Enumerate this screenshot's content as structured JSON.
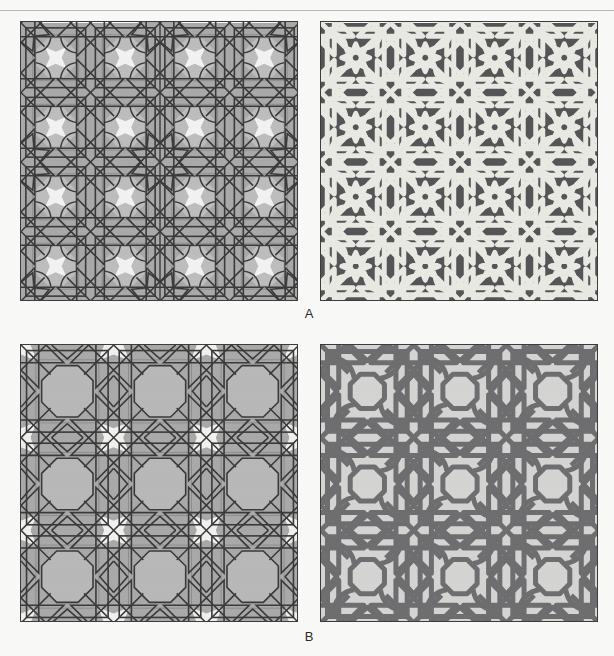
{
  "figure": {
    "caption_rows": [
      {
        "id": "A",
        "label": "A"
      },
      {
        "id": "B",
        "label": "B"
      }
    ],
    "panels": [
      {
        "id": "a-left",
        "name": "pattern-A-construction",
        "row": "A",
        "column": "left",
        "style": "tiling-with-line-overlay",
        "description": "Gray polygonal tiling with thin dark-grey overlay of an 8-pointed star polygonal network; white four-pointed rosette tiles.",
        "colors": {
          "background_tile": "#a9a9a9",
          "secondary_tile": "#bdbdbd",
          "highlight_tile": "#f2f2f2",
          "line": "#3a3a3a",
          "faint_line": "#8d8d8d",
          "border": "#3c3c3c"
        },
        "grid": {
          "cells_x": 4,
          "cells_y": 4
        },
        "line_width": 1.6
      },
      {
        "id": "a-right",
        "name": "pattern-A-interlace",
        "row": "A",
        "column": "right",
        "style": "interlaced-strapwork",
        "description": "Dark charcoal field with wide light-grey interlacing strapwork forming 8-pointed stars.",
        "colors": {
          "field": "#555557",
          "strap": "#e9e9e4",
          "strap_edge": "#d2d2cd",
          "border": "#2f2f2f"
        },
        "grid": {
          "cells_x": 4,
          "cells_y": 4
        },
        "line_width": 5.0
      },
      {
        "id": "b-left",
        "name": "pattern-B-construction",
        "row": "B",
        "column": "left",
        "style": "tiling-with-line-overlay",
        "description": "Gray polygonal tiling with dark line network of larger 8-pointed stars and hexagonal rosettes.",
        "colors": {
          "background_tile": "#a9a9a9",
          "secondary_tile": "#b8b8b8",
          "highlight_tile": "#f0f0ee",
          "line": "#3a3a3a",
          "faint_line": "#8d8d8d",
          "border": "#3c3c3c"
        },
        "grid": {
          "cells_x": 3,
          "cells_y": 3
        },
        "line_width": 1.6
      },
      {
        "id": "b-right",
        "name": "pattern-B-interlace",
        "row": "B",
        "column": "right",
        "style": "interlaced-strapwork",
        "description": "Light grey field with medium-grey wide interlacing strapwork forming large 8-pointed stars.",
        "colors": {
          "field": "#d4d4d2",
          "strap": "#6e6e70",
          "strap_edge": "#5c5c5e",
          "border": "#3c3c3c"
        },
        "grid": {
          "cells_x": 3,
          "cells_y": 3
        },
        "line_width": 5.0
      }
    ]
  },
  "page": {
    "background": "#f9f9f7",
    "rule_color": "#b9b9bb",
    "top_fragment": ""
  }
}
